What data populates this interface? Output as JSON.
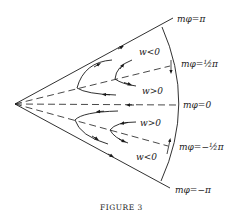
{
  "figure": {
    "caption": "FIGURE 3",
    "boundary_labels": {
      "top": "mφ=π",
      "upper_half": "mφ=½π",
      "zero": "mφ=0",
      "lower_half": "mφ=−½π",
      "bottom": "mφ=−π"
    },
    "region_labels": {
      "upper_outer": "w<0",
      "upper_inner": "w>0",
      "lower_inner": "w>0",
      "lower_outer": "w<0"
    },
    "colors": {
      "stroke": "#1a1a1a",
      "background": "#ffffff"
    }
  }
}
